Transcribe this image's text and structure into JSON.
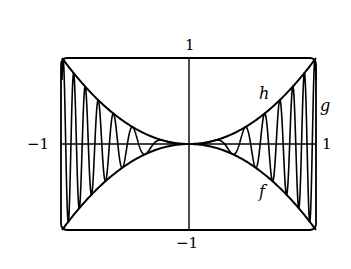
{
  "chart_data": {
    "type": "line",
    "title": "",
    "xlabel": "",
    "ylabel": "",
    "xlim": [
      -1,
      1
    ],
    "ylim": [
      -1,
      1
    ],
    "grid": false,
    "legend": "none (curves labeled inline)",
    "axis_tick_labels": {
      "x_left": "−1",
      "x_right": "1",
      "y_top": "1",
      "y_bottom": "−1"
    },
    "series": [
      {
        "name": "h",
        "label": "h",
        "description": "upper envelope, h(x) = x^2",
        "formula": "x^2"
      },
      {
        "name": "f",
        "label": "f",
        "description": "lower envelope, f(x) = -x^2",
        "formula": "-x^2"
      },
      {
        "name": "g",
        "label": "g",
        "description": "oscillating curve squeezed between f and h, frequency increasing toward x = ±1",
        "formula": "x^2 sin(40 x^2)"
      }
    ],
    "annotations": [
      {
        "text": "h",
        "near": "upper-right envelope"
      },
      {
        "text": "g",
        "near": "right edge, oscillating curve"
      },
      {
        "text": "f",
        "near": "lower-right envelope"
      }
    ]
  },
  "labels": {
    "y_top": "1",
    "y_bottom": "−1",
    "x_left": "−1",
    "x_right": "1",
    "h": "h",
    "g": "g",
    "f": "f"
  }
}
